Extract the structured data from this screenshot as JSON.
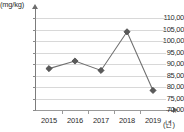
{
  "chart_data": {
    "type": "line",
    "title": "",
    "subtitle": "",
    "xlabel": "(년)",
    "ylabel": "(mg/kg)",
    "categories": [
      "2015",
      "2016",
      "2017",
      "2018",
      "2019"
    ],
    "values": [
      88.0,
      91.3,
      87.2,
      104.0,
      78.5
    ],
    "series": [
      {
        "name": "",
        "values": [
          88.0,
          91.3,
          87.2,
          104.0,
          78.5
        ]
      }
    ],
    "ylim": [
      70.0,
      110.0
    ],
    "ytick_step": 5,
    "ytick_labels": [
      "110,00",
      "105,00",
      "100,00",
      "95,00",
      "90,00",
      "85,00",
      "80,00",
      "75,00",
      "70,00"
    ],
    "ytick_values": [
      110,
      105,
      100,
      95,
      90,
      85,
      80,
      75,
      70
    ],
    "xtick_labels": [
      "2015",
      "2016",
      "2017",
      "2018",
      "2019"
    ],
    "grid": true,
    "legend": false,
    "legend_position": "none",
    "marker": "diamond",
    "line_color": "#6f6f6f",
    "marker_color": "#5a5a5a",
    "grid_color": "#d8d8d8",
    "axis_color": "#7c7c7c",
    "text_color": "#2b2b2b",
    "annotations": []
  }
}
